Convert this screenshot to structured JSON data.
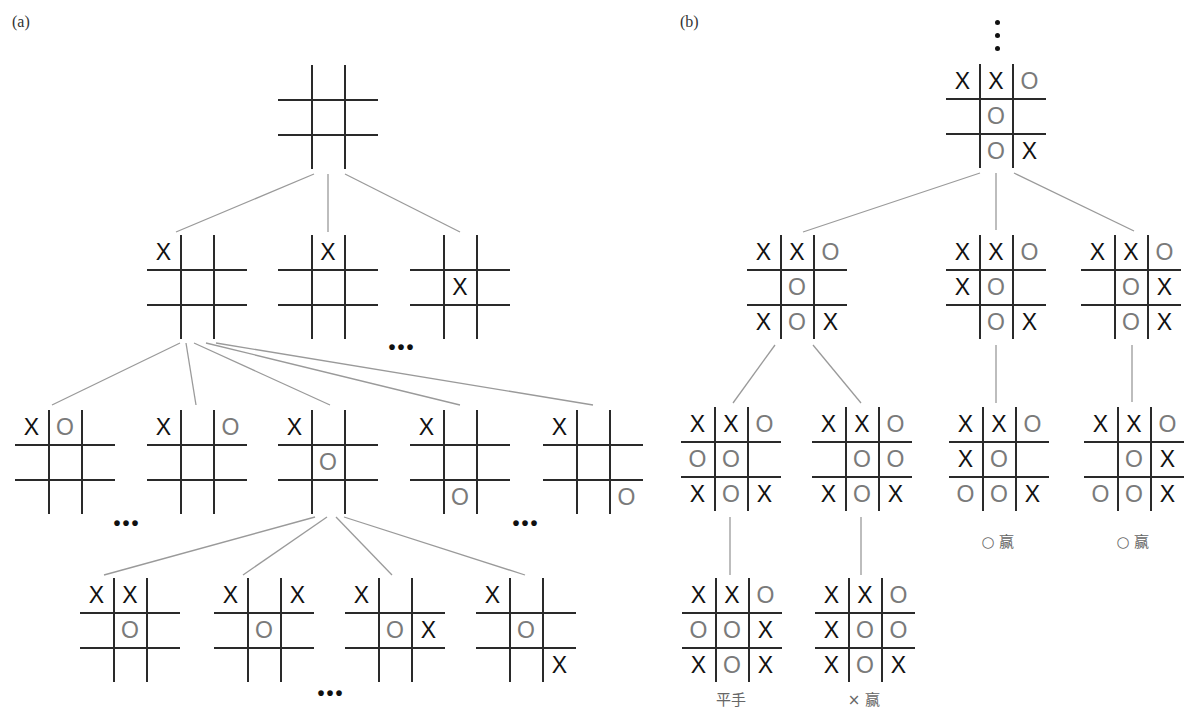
{
  "panels": [
    {
      "id": "a",
      "label": "(a)",
      "x": 12,
      "y": 13
    },
    {
      "id": "b",
      "label": "(b)",
      "x": 680,
      "y": 13
    }
  ],
  "colors": {
    "x_mark": "#111111",
    "o_mark": "#7a7a7a",
    "grid": "#2a2a2a",
    "edge": "#9a9a9a"
  },
  "boards": [
    {
      "id": "a0",
      "panel": "a",
      "x": 278,
      "y": 65,
      "cells": [
        "",
        "",
        "",
        "",
        "",
        "",
        "",
        "",
        ""
      ]
    },
    {
      "id": "a1",
      "panel": "a",
      "x": 147,
      "y": 235,
      "cells": [
        "X",
        "",
        "",
        "",
        "",
        "",
        "",
        "",
        ""
      ]
    },
    {
      "id": "a2",
      "panel": "a",
      "x": 278,
      "y": 235,
      "cells": [
        "",
        "X",
        "",
        "",
        "",
        "",
        "",
        "",
        ""
      ]
    },
    {
      "id": "a3",
      "panel": "a",
      "x": 410,
      "y": 235,
      "cells": [
        "",
        "",
        "",
        "",
        "X",
        "",
        "",
        "",
        ""
      ]
    },
    {
      "id": "a4",
      "panel": "a",
      "x": 15,
      "y": 410,
      "cells": [
        "X",
        "O",
        "",
        "",
        "",
        "",
        "",
        "",
        ""
      ]
    },
    {
      "id": "a5",
      "panel": "a",
      "x": 147,
      "y": 410,
      "cells": [
        "X",
        "",
        "O",
        "",
        "",
        "",
        "",
        "",
        ""
      ]
    },
    {
      "id": "a6",
      "panel": "a",
      "x": 278,
      "y": 410,
      "cells": [
        "X",
        "",
        "",
        "",
        "O",
        "",
        "",
        "",
        ""
      ]
    },
    {
      "id": "a7",
      "panel": "a",
      "x": 410,
      "y": 410,
      "cells": [
        "X",
        "",
        "",
        "",
        "",
        "",
        "",
        "O",
        ""
      ]
    },
    {
      "id": "a8",
      "panel": "a",
      "x": 543,
      "y": 410,
      "cells": [
        "X",
        "",
        "",
        "",
        "",
        "",
        "",
        "",
        "O"
      ]
    },
    {
      "id": "a9",
      "panel": "a",
      "x": 80,
      "y": 578,
      "cells": [
        "X",
        "X",
        "",
        "",
        "O",
        "",
        "",
        "",
        ""
      ]
    },
    {
      "id": "a10",
      "panel": "a",
      "x": 214,
      "y": 578,
      "cells": [
        "X",
        "",
        "X",
        "",
        "O",
        "",
        "",
        "",
        ""
      ]
    },
    {
      "id": "a11",
      "panel": "a",
      "x": 345,
      "y": 578,
      "cells": [
        "X",
        "",
        "",
        "",
        "O",
        "X",
        "",
        "",
        ""
      ]
    },
    {
      "id": "a12",
      "panel": "a",
      "x": 476,
      "y": 578,
      "cells": [
        "X",
        "",
        "",
        "",
        "O",
        "",
        "",
        "",
        "X"
      ]
    },
    {
      "id": "b0",
      "panel": "b",
      "x": 946,
      "y": 64,
      "cells": [
        "X",
        "X",
        "O",
        "",
        "O",
        "",
        "",
        "O",
        "X"
      ]
    },
    {
      "id": "b1",
      "panel": "b",
      "x": 747,
      "y": 235,
      "cells": [
        "X",
        "X",
        "O",
        "",
        "O",
        "",
        "X",
        "O",
        "X"
      ]
    },
    {
      "id": "b2",
      "panel": "b",
      "x": 946,
      "y": 235,
      "cells": [
        "X",
        "X",
        "O",
        "X",
        "O",
        "",
        "",
        "O",
        "X"
      ]
    },
    {
      "id": "b3",
      "panel": "b",
      "x": 1081,
      "y": 235,
      "cells": [
        "X",
        "X",
        "O",
        "",
        "O",
        "X",
        "",
        "O",
        "X"
      ]
    },
    {
      "id": "b4",
      "panel": "b",
      "x": 681,
      "y": 407,
      "cells": [
        "X",
        "X",
        "O",
        "O",
        "O",
        "",
        "X",
        "O",
        "X"
      ]
    },
    {
      "id": "b5",
      "panel": "b",
      "x": 812,
      "y": 407,
      "cells": [
        "X",
        "X",
        "O",
        "",
        "O",
        "O",
        "X",
        "O",
        "X"
      ]
    },
    {
      "id": "b6",
      "panel": "b",
      "x": 949,
      "y": 407,
      "cells": [
        "X",
        "X",
        "O",
        "X",
        "O",
        "",
        "O",
        "O",
        "X"
      ]
    },
    {
      "id": "b7",
      "panel": "b",
      "x": 1084,
      "y": 407,
      "cells": [
        "X",
        "X",
        "O",
        "",
        "O",
        "X",
        "O",
        "O",
        "X"
      ]
    },
    {
      "id": "b8",
      "panel": "b",
      "x": 682,
      "y": 578,
      "cells": [
        "X",
        "X",
        "O",
        "O",
        "O",
        "X",
        "X",
        "O",
        "X"
      ]
    },
    {
      "id": "b9",
      "panel": "b",
      "x": 815,
      "y": 578,
      "cells": [
        "X",
        "X",
        "O",
        "X",
        "O",
        "O",
        "X",
        "O",
        "X"
      ]
    }
  ],
  "edges": [
    [
      314,
      174,
      176,
      232
    ],
    [
      328,
      174,
      328,
      232
    ],
    [
      345,
      174,
      460,
      232
    ],
    [
      180,
      343,
      52,
      405
    ],
    [
      186,
      343,
      196,
      405
    ],
    [
      194,
      343,
      330,
      405
    ],
    [
      206,
      343,
      460,
      405
    ],
    [
      216,
      343,
      593,
      405
    ],
    [
      315,
      517,
      104,
      575
    ],
    [
      327,
      517,
      243,
      575
    ],
    [
      336,
      517,
      392,
      575
    ],
    [
      344,
      517,
      525,
      575
    ],
    [
      980,
      173,
      803,
      232
    ],
    [
      996,
      173,
      996,
      230
    ],
    [
      1014,
      173,
      1134,
      231
    ],
    [
      775,
      345,
      733,
      403
    ],
    [
      813,
      345,
      861,
      403
    ],
    [
      996,
      345,
      996,
      403
    ],
    [
      1132,
      345,
      1132,
      402
    ],
    [
      730,
      517,
      730,
      575
    ],
    [
      861,
      517,
      861,
      575
    ]
  ],
  "ellipses": [
    {
      "text": "•••",
      "x": 402,
      "y": 336
    },
    {
      "text": "•••",
      "x": 127,
      "y": 512
    },
    {
      "text": "•••",
      "x": 526,
      "y": 512
    },
    {
      "text": "•••",
      "x": 331,
      "y": 682
    }
  ],
  "vertical_ellipsis": {
    "x": 995,
    "y": 20
  },
  "outcomes": [
    {
      "text": "平手",
      "x": 731,
      "y": 688
    },
    {
      "text": "× 赢",
      "x": 864,
      "y": 688
    },
    {
      "text": "○ 赢",
      "x": 998,
      "y": 530
    },
    {
      "text": "○ 赢",
      "x": 1133,
      "y": 530
    }
  ]
}
